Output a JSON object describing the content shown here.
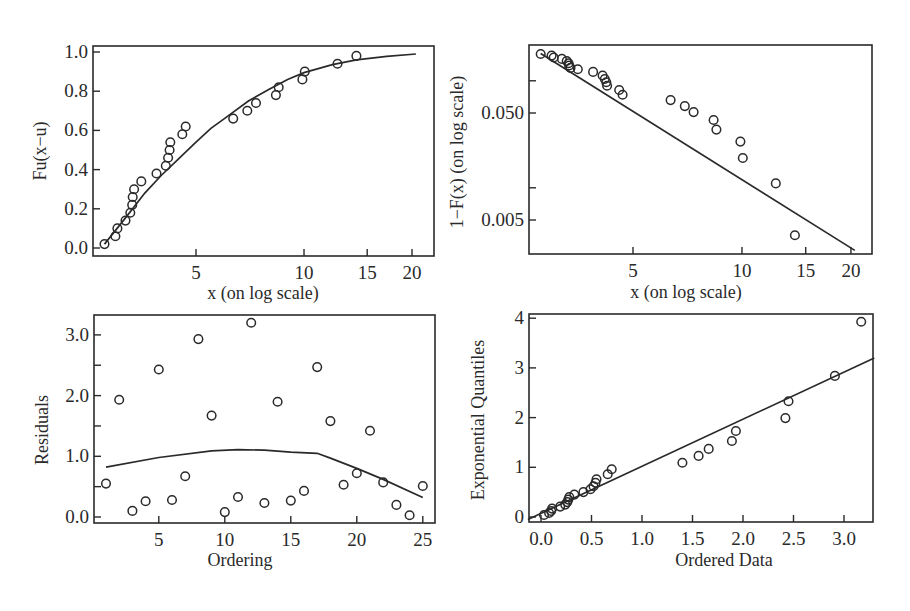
{
  "chart_data": [
    {
      "id": "cdf",
      "type": "scatter",
      "title": "",
      "xlabel": "x (on log scale)",
      "ylabel": "Fu(x−u)",
      "xscale": "log",
      "xlim": [
        2.7,
        23
      ],
      "ylim": [
        -0.02,
        1.06
      ],
      "xticks": [
        5,
        10,
        15,
        20
      ],
      "yticks": [
        0.0,
        0.2,
        0.4,
        0.6,
        0.8,
        1.0
      ],
      "ytick_labels": [
        "0.0",
        "0.2",
        "0.4",
        "0.6",
        "0.8",
        "1.0"
      ],
      "points": [
        [
          2.78,
          0.02
        ],
        [
          2.98,
          0.06
        ],
        [
          3.02,
          0.1
        ],
        [
          3.18,
          0.14
        ],
        [
          3.28,
          0.18
        ],
        [
          3.32,
          0.22
        ],
        [
          3.33,
          0.26
        ],
        [
          3.36,
          0.3
        ],
        [
          3.52,
          0.34
        ],
        [
          3.88,
          0.38
        ],
        [
          4.12,
          0.42
        ],
        [
          4.18,
          0.46
        ],
        [
          4.22,
          0.5
        ],
        [
          4.24,
          0.54
        ],
        [
          4.58,
          0.58
        ],
        [
          4.68,
          0.62
        ],
        [
          6.35,
          0.66
        ],
        [
          6.95,
          0.7
        ],
        [
          7.35,
          0.74
        ],
        [
          8.35,
          0.78
        ],
        [
          8.5,
          0.82
        ],
        [
          9.9,
          0.86
        ],
        [
          10.05,
          0.9
        ],
        [
          12.4,
          0.94
        ],
        [
          14.0,
          0.98
        ]
      ],
      "fit_line": [
        [
          2.78,
          0.02
        ],
        [
          3.2,
          0.16
        ],
        [
          3.6,
          0.28
        ],
        [
          4.0,
          0.37
        ],
        [
          4.5,
          0.46
        ],
        [
          5.0,
          0.54
        ],
        [
          5.5,
          0.61
        ],
        [
          6.0,
          0.66
        ],
        [
          7.0,
          0.75
        ],
        [
          8.0,
          0.81
        ],
        [
          9.0,
          0.86
        ],
        [
          10.0,
          0.895
        ],
        [
          12.0,
          0.935
        ],
        [
          14.0,
          0.96
        ],
        [
          17.0,
          0.978
        ],
        [
          20.5,
          0.99
        ]
      ]
    },
    {
      "id": "survival",
      "type": "scatter",
      "title": "",
      "xlabel": "x (on log scale)",
      "ylabel": "1−F(x) (on log scale)",
      "xscale": "log",
      "yscale": "log",
      "xlim": [
        2.7,
        23
      ],
      "ylim": [
        0.0017,
        0.22
      ],
      "xticks": [
        5,
        10,
        15,
        20
      ],
      "yticks": [
        0.1,
        0.05,
        0.01,
        0.005
      ],
      "ytick_labels": [
        "",
        "0.050",
        "",
        "0.005"
      ],
      "points": [
        [
          2.78,
          0.178
        ],
        [
          2.98,
          0.172
        ],
        [
          3.02,
          0.165
        ],
        [
          3.18,
          0.16
        ],
        [
          3.28,
          0.153
        ],
        [
          3.32,
          0.146
        ],
        [
          3.33,
          0.139
        ],
        [
          3.36,
          0.132
        ],
        [
          3.52,
          0.128
        ],
        [
          3.88,
          0.121
        ],
        [
          4.12,
          0.112
        ],
        [
          4.18,
          0.104
        ],
        [
          4.22,
          0.097
        ],
        [
          4.24,
          0.09
        ],
        [
          4.58,
          0.082
        ],
        [
          4.68,
          0.074
        ],
        [
          6.35,
          0.066
        ],
        [
          6.95,
          0.058
        ],
        [
          7.35,
          0.051
        ],
        [
          8.35,
          0.043
        ],
        [
          8.5,
          0.035
        ],
        [
          9.9,
          0.027
        ],
        [
          10.05,
          0.019
        ],
        [
          12.4,
          0.011
        ],
        [
          14.0,
          0.0036
        ]
      ],
      "fit_line": [
        [
          2.78,
          0.18
        ],
        [
          20.5,
          0.0026
        ]
      ]
    },
    {
      "id": "residuals",
      "type": "scatter",
      "title": "",
      "xlabel": "Ordering",
      "ylabel": "Residuals",
      "xlim": [
        0.3,
        25.8
      ],
      "ylim": [
        -0.1,
        3.3
      ],
      "xticks": [
        5,
        10,
        15,
        20,
        25
      ],
      "yticks": [
        0.0,
        0.5,
        1.0,
        1.5,
        2.0,
        2.5,
        3.0
      ],
      "ytick_labels": [
        "0.0",
        "",
        "1.0",
        "",
        "2.0",
        "",
        "3.0"
      ],
      "points": [
        [
          1,
          0.55
        ],
        [
          2,
          1.93
        ],
        [
          3,
          0.1
        ],
        [
          4,
          0.26
        ],
        [
          5,
          2.43
        ],
        [
          6,
          0.28
        ],
        [
          7,
          0.67
        ],
        [
          8,
          2.93
        ],
        [
          9,
          1.67
        ],
        [
          10,
          0.08
        ],
        [
          11,
          0.33
        ],
        [
          12,
          3.2
        ],
        [
          13,
          0.23
        ],
        [
          14,
          1.9
        ],
        [
          15,
          0.27
        ],
        [
          16,
          0.43
        ],
        [
          17,
          2.47
        ],
        [
          18,
          1.58
        ],
        [
          19,
          0.53
        ],
        [
          20,
          0.72
        ],
        [
          21,
          1.42
        ],
        [
          22,
          0.57
        ],
        [
          23,
          0.2
        ],
        [
          24,
          0.03
        ],
        [
          25,
          0.51
        ]
      ],
      "fit_line": [
        [
          1,
          0.82
        ],
        [
          5,
          0.98
        ],
        [
          9,
          1.09
        ],
        [
          11,
          1.11
        ],
        [
          13,
          1.1
        ],
        [
          15,
          1.07
        ],
        [
          17,
          1.05
        ],
        [
          18,
          0.97
        ],
        [
          20,
          0.8
        ],
        [
          22,
          0.62
        ],
        [
          25,
          0.32
        ]
      ]
    },
    {
      "id": "qq",
      "type": "scatter",
      "title": "",
      "xlabel": "Ordered Data",
      "ylabel": "Exponential Quantiles",
      "xlim": [
        -0.13,
        3.3
      ],
      "ylim": [
        -0.1,
        4.06
      ],
      "xticks": [
        0.0,
        0.5,
        1.0,
        1.5,
        2.0,
        2.5,
        3.0
      ],
      "xtick_labels": [
        "0.0",
        "0.5",
        "1.0",
        "1.5",
        "2.0",
        "2.5",
        "3.0"
      ],
      "yticks": [
        0,
        1,
        2,
        3,
        4
      ],
      "ytick_labels": [
        "0",
        "1",
        "2",
        "3",
        "4"
      ],
      "points": [
        [
          0.03,
          0.04
        ],
        [
          0.08,
          0.08
        ],
        [
          0.1,
          0.12
        ],
        [
          0.11,
          0.17
        ],
        [
          0.19,
          0.21
        ],
        [
          0.24,
          0.25
        ],
        [
          0.26,
          0.3
        ],
        [
          0.27,
          0.35
        ],
        [
          0.28,
          0.4
        ],
        [
          0.33,
          0.45
        ],
        [
          0.42,
          0.5
        ],
        [
          0.49,
          0.56
        ],
        [
          0.52,
          0.62
        ],
        [
          0.54,
          0.69
        ],
        [
          0.55,
          0.76
        ],
        [
          0.66,
          0.86
        ],
        [
          0.7,
          0.96
        ],
        [
          1.4,
          1.09
        ],
        [
          1.56,
          1.23
        ],
        [
          1.66,
          1.37
        ],
        [
          1.89,
          1.53
        ],
        [
          1.93,
          1.73
        ],
        [
          2.42,
          1.99
        ],
        [
          2.45,
          2.33
        ],
        [
          2.91,
          2.84
        ],
        [
          3.17,
          3.93
        ]
      ],
      "fit_line": [
        [
          -0.13,
          -0.05
        ],
        [
          3.3,
          3.2
        ]
      ]
    }
  ]
}
